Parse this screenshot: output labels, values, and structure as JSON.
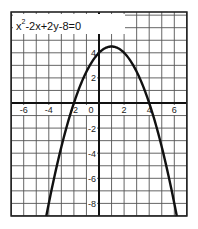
{
  "chart_data": {
    "type": "line",
    "title_parts": {
      "base": "x",
      "exp": "2",
      "rest": "-2x+2y-8=0"
    },
    "xlabel": "",
    "ylabel": "",
    "xlim": [
      -7,
      7
    ],
    "ylim": [
      -9,
      7
    ],
    "grid": true,
    "grid_step": 1,
    "x_ticks": [
      -6,
      -4,
      -2,
      0,
      2,
      4,
      6
    ],
    "x_tick_labels": [
      "-6",
      "-4",
      "-2",
      "0",
      "2",
      "4",
      "6"
    ],
    "y_ticks": [
      4,
      2,
      -2,
      -4,
      -6,
      -8
    ],
    "y_tick_labels": [
      "4",
      "2",
      "-2",
      "-4",
      "-6",
      "-8"
    ],
    "series": [
      {
        "name": "parabola",
        "equation": "y = (-x^2 + 2x + 8)/2",
        "vertex": [
          1,
          4.5
        ],
        "x_intercepts": [
          -2,
          4
        ],
        "y_intercept": 4,
        "x": [
          -4.2,
          -4,
          -3,
          -2,
          -1,
          0,
          1,
          2,
          3,
          4,
          5,
          6,
          6.2
        ],
        "y": [
          -9.0,
          -8,
          -3.5,
          0,
          2.5,
          4,
          4.5,
          4,
          2.5,
          0,
          -3.5,
          -8,
          -9.0
        ]
      }
    ]
  }
}
